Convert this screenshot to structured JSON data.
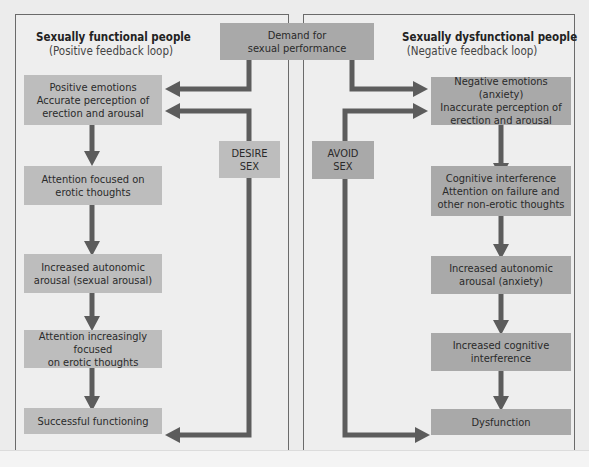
{
  "diagram": {
    "demand_box": {
      "label": "Demand for\nsexual performance"
    },
    "left_panel": {
      "title": "Sexually functional people",
      "subtitle": "(Positive feedback loop)",
      "decision_label": "DESIRE\nSEX",
      "steps": [
        "Positive emotions\nAccurate perception of\nerection and arousal",
        "Attention focused on\nerotic thoughts",
        "Increased autonomic\narousal (sexual arousal)",
        "Attention increasingly focused\non erotic thoughts",
        "Successful functioning"
      ]
    },
    "right_panel": {
      "title": "Sexually dysfunctional people",
      "subtitle": "(Negative feedback loop)",
      "decision_label": "AVOID\nSEX",
      "steps": [
        "Negative emotions (anxiety)\nInaccurate perception of\nerection and arousal",
        "Cognitive interference\nAttention on failure and\nother non-erotic thoughts",
        "Increased autonomic\narousal (anxiety)",
        "Increased cognitive\ninterference",
        "Dysfunction"
      ]
    },
    "colors": {
      "background": "#ececec",
      "panel_border": "#6a6a6a",
      "box_light": "#bdbdbd",
      "box_dark": "#a9a9a9",
      "arrow": "#5c5c5c"
    }
  }
}
